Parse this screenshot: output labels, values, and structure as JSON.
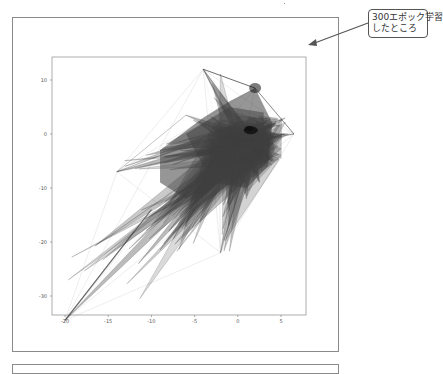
{
  "annotation": {
    "line1": "300エポック学習",
    "line2": "したところ",
    "arrow_color": "#555555"
  },
  "chart_data": {
    "type": "line",
    "title": "",
    "xlabel": "",
    "ylabel": "",
    "xlim": [
      -21.5,
      7.5
    ],
    "ylim": [
      -37,
      14.5
    ],
    "x_ticks": [
      -20,
      -15,
      -10,
      -5,
      0,
      5
    ],
    "x_tick_labels": [
      "-20",
      "-15",
      "-10",
      "-5",
      "0",
      "5"
    ],
    "y_ticks": [
      10,
      0,
      -10,
      -20,
      -30
    ],
    "y_tick_labels": [
      "10",
      "0",
      "-10",
      "-20",
      "-30"
    ],
    "grid": false,
    "legend": null,
    "color": "#404040",
    "key_points": {
      "dense_center": [
        1.0,
        1.0
      ],
      "upper_cluster": [
        2.0,
        8.5
      ],
      "top_left_vertex": [
        -4.0,
        12.0
      ],
      "far_left_vertex": [
        -14.0,
        -7.0
      ],
      "bottom_left_tip": [
        -20.0,
        -34.5
      ],
      "right_vertex": [
        6.5,
        0.0
      ],
      "lower_spike_tip": [
        -2.0,
        -22.0
      ]
    },
    "spike_tips": [
      [
        -20.0,
        -34.5
      ],
      [
        -14.0,
        -7.0
      ],
      [
        -11.5,
        -24.0
      ],
      [
        -9.0,
        -21.5
      ],
      [
        -8.0,
        -18.0
      ],
      [
        -6.5,
        -17.5
      ],
      [
        -5.5,
        -14.0
      ],
      [
        -2.0,
        -22.0
      ],
      [
        -1.0,
        -11.0
      ],
      [
        1.0,
        -12.0
      ],
      [
        2.5,
        -9.0
      ],
      [
        4.0,
        -5.0
      ],
      [
        6.5,
        0.0
      ],
      [
        5.5,
        3.0
      ],
      [
        -4.0,
        12.0
      ],
      [
        -6.0,
        3.5
      ],
      [
        -9.0,
        -3.0
      ]
    ]
  }
}
